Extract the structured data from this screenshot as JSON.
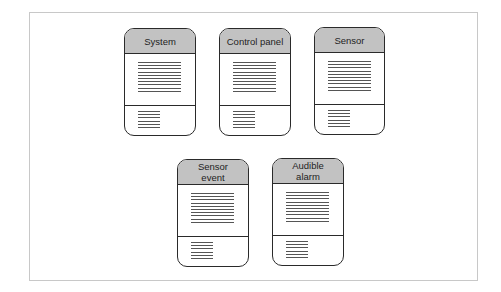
{
  "diagram": {
    "type": "class-cards",
    "colors": {
      "header_fill": "#c2c2c2",
      "border": "#2a2a2a",
      "placeholder_lines": "#555555",
      "frame": "#c8c8c8"
    },
    "cards": [
      {
        "name": "System",
        "attribute_lines": 10,
        "operation_lines": 6
      },
      {
        "name": "Control panel",
        "attribute_lines": 10,
        "operation_lines": 6
      },
      {
        "name": "Sensor",
        "attribute_lines": 10,
        "operation_lines": 6
      },
      {
        "name": "Sensor\nevent",
        "attribute_lines": 10,
        "operation_lines": 6
      },
      {
        "name": "Audible\nalarm",
        "attribute_lines": 10,
        "operation_lines": 6
      }
    ]
  }
}
